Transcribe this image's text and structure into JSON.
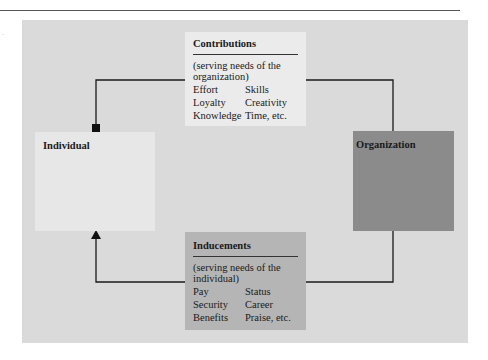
{
  "diagram": {
    "contributions": {
      "title": "Contributions",
      "description": "(serving needs of the organization)",
      "items": [
        [
          "Effort",
          "Skills"
        ],
        [
          "Loyalty",
          "Creativity"
        ],
        [
          "Knowledge",
          "Time, etc."
        ]
      ]
    },
    "inducements": {
      "title": "Inducements",
      "description": "(serving needs of the individual)",
      "items": [
        [
          "Pay",
          "Status"
        ],
        [
          "Security",
          "Career"
        ],
        [
          "Benefits",
          "Praise, etc."
        ]
      ]
    },
    "individual": {
      "label": "Individual"
    },
    "organization": {
      "label": "Organization"
    },
    "colors": {
      "panel": "#dadada",
      "contributions_box": "#ebebeb",
      "inducements_box": "#b5b5b5",
      "individual_box": "#e7e7e7",
      "organization_box": "#8b8b8b",
      "connector": "#1a1a1a"
    }
  }
}
